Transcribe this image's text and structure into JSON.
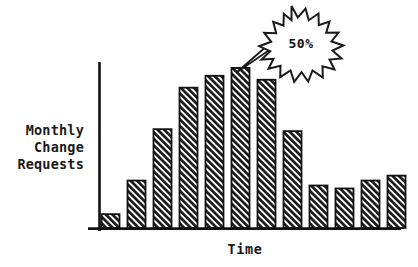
{
  "chart_data": {
    "type": "bar",
    "title": "",
    "xlabel": "Time",
    "ylabel": "Monthly Change Requests",
    "ylabel_lines": [
      "Monthly",
      "Change",
      "Requests"
    ],
    "categories": [
      "1",
      "2",
      "3",
      "4",
      "5",
      "6",
      "7",
      "8",
      "9",
      "10",
      "11",
      "12"
    ],
    "values": [
      14,
      48,
      100,
      142,
      154,
      162,
      150,
      98,
      43,
      40,
      48,
      53
    ],
    "series": [
      {
        "name": "Monthly Change Requests",
        "values": [
          14,
          48,
          100,
          142,
          154,
          162,
          150,
          98,
          43,
          40,
          48,
          53
        ]
      }
    ],
    "ylim": [
      0,
      170
    ],
    "grid": false,
    "legend": false,
    "tick_labels_x": [],
    "tick_labels_y": [],
    "annotations": [
      {
        "text": "50%",
        "shape": "starburst",
        "points_to_category": "6",
        "description": "starburst callout pointing at the tallest bar"
      }
    ],
    "bar_fill": "diagonal-hatch",
    "bar_outline_color": "#111111",
    "axis_color": "#111111",
    "background_color": "#ffffff"
  },
  "figure": {
    "y_axis_label": {
      "line1": "Monthly",
      "line2": "Change",
      "line3": "Requests"
    },
    "x_axis_label": "Time",
    "callout": {
      "value": "50%"
    }
  }
}
